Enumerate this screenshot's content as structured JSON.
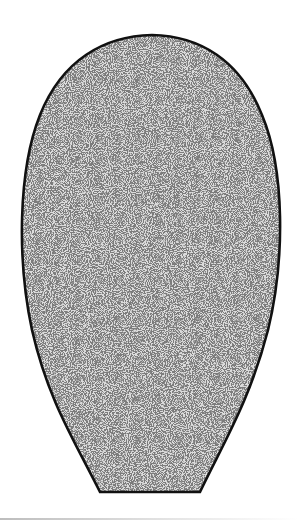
{
  "figure": {
    "description": "Stippled rounded-top shape with flat truncated base",
    "shape": "egg-shaped outline tapering to a flat base",
    "fill_color": "#bfbfbf",
    "stipple_dot_color": "#555555",
    "outline_color": "#111111",
    "background_color": "#ffffff"
  }
}
